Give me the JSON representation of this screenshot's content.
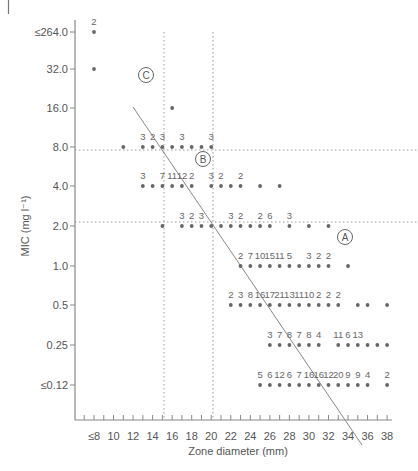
{
  "chart_data": {
    "type": "scatter",
    "title": "",
    "xlabel": "Zone diameter (mm)",
    "ylabel": "MIC (mg l⁻¹)",
    "x_ticks": [
      "≤8",
      "10",
      "12",
      "14",
      "16",
      "18",
      "20",
      "22",
      "24",
      "26",
      "28",
      "30",
      "32",
      "34",
      "36",
      "38"
    ],
    "y_ticks": [
      "≤264.0",
      "32.0",
      "16.0",
      "8.0",
      "4.0",
      "2.0",
      "1.0",
      "0.5",
      "0.25",
      "≤0.12"
    ],
    "x_range": [
      8,
      38
    ],
    "grid": false,
    "breakpoints": {
      "zone_vertical_mm": [
        15,
        20
      ],
      "mic_horizontal": [
        "8.0",
        "2.0"
      ]
    },
    "regression_line": {
      "from": {
        "x_mm": 12,
        "y_pixel_row": 107
      },
      "to": {
        "x_mm": 35.5,
        "y_pixel_row": 445
      }
    },
    "region_labels": [
      {
        "label": "A",
        "x_mm": 35,
        "mic": "between 2.0 and 1.0"
      },
      {
        "label": "B",
        "x_mm": 19,
        "mic": "between 8.0 and 4.0"
      },
      {
        "label": "C",
        "x_mm": 14,
        "mic": "32.0"
      }
    ],
    "rows": [
      {
        "mic": "≤264.0",
        "points": [
          {
            "x": 8,
            "n": "2"
          }
        ]
      },
      {
        "mic": "32.0",
        "points": [
          {
            "x": 8,
            "n": ""
          }
        ]
      },
      {
        "mic": "16.0",
        "points": [
          {
            "x": 16,
            "n": ""
          }
        ]
      },
      {
        "mic": "8.0",
        "points": [
          {
            "x": 11,
            "n": ""
          },
          {
            "x": 13,
            "n": "3"
          },
          {
            "x": 14,
            "n": "2"
          },
          {
            "x": 15,
            "n": "3"
          },
          {
            "x": 16,
            "n": ""
          },
          {
            "x": 17,
            "n": "3"
          },
          {
            "x": 18,
            "n": ""
          },
          {
            "x": 19,
            "n": ""
          },
          {
            "x": 20,
            "n": "3"
          }
        ]
      },
      {
        "mic": "4.0",
        "points": [
          {
            "x": 13,
            "n": "3"
          },
          {
            "x": 14,
            "n": ""
          },
          {
            "x": 15,
            "n": "7"
          },
          {
            "x": 16,
            "n": "11"
          },
          {
            "x": 17,
            "n": "12"
          },
          {
            "x": 18,
            "n": "2"
          },
          {
            "x": 20,
            "n": "3"
          },
          {
            "x": 21,
            "n": "2"
          },
          {
            "x": 22,
            "n": ""
          },
          {
            "x": 23,
            "n": "2"
          },
          {
            "x": 25,
            "n": ""
          },
          {
            "x": 27,
            "n": ""
          }
        ]
      },
      {
        "mic": "2.0",
        "points": [
          {
            "x": 15,
            "n": ""
          },
          {
            "x": 17,
            "n": "3"
          },
          {
            "x": 18,
            "n": "2"
          },
          {
            "x": 19,
            "n": "3"
          },
          {
            "x": 20,
            "n": ""
          },
          {
            "x": 21,
            "n": ""
          },
          {
            "x": 22,
            "n": "3"
          },
          {
            "x": 23,
            "n": "2"
          },
          {
            "x": 24,
            "n": ""
          },
          {
            "x": 25,
            "n": "2"
          },
          {
            "x": 26,
            "n": "6"
          },
          {
            "x": 28,
            "n": "3"
          },
          {
            "x": 30,
            "n": ""
          },
          {
            "x": 32,
            "n": ""
          }
        ]
      },
      {
        "mic": "1.0",
        "points": [
          {
            "x": 23,
            "n": "2"
          },
          {
            "x": 24,
            "n": "7"
          },
          {
            "x": 25,
            "n": "10"
          },
          {
            "x": 26,
            "n": "15"
          },
          {
            "x": 27,
            "n": "11"
          },
          {
            "x": 28,
            "n": "5"
          },
          {
            "x": 29,
            "n": ""
          },
          {
            "x": 30,
            "n": "3"
          },
          {
            "x": 31,
            "n": "2"
          },
          {
            "x": 32,
            "n": "2"
          },
          {
            "x": 34,
            "n": ""
          }
        ]
      },
      {
        "mic": "0.5",
        "points": [
          {
            "x": 22,
            "n": "2"
          },
          {
            "x": 23,
            "n": "3"
          },
          {
            "x": 24,
            "n": "8"
          },
          {
            "x": 25,
            "n": "16"
          },
          {
            "x": 26,
            "n": "17"
          },
          {
            "x": 27,
            "n": "21"
          },
          {
            "x": 28,
            "n": "13"
          },
          {
            "x": 29,
            "n": "11"
          },
          {
            "x": 30,
            "n": "10"
          },
          {
            "x": 31,
            "n": "2"
          },
          {
            "x": 32,
            "n": "2"
          },
          {
            "x": 33,
            "n": "2"
          },
          {
            "x": 35,
            "n": ""
          },
          {
            "x": 36,
            "n": ""
          },
          {
            "x": 38,
            "n": ""
          }
        ]
      },
      {
        "mic": "0.25",
        "points": [
          {
            "x": 26,
            "n": "3"
          },
          {
            "x": 27,
            "n": "7"
          },
          {
            "x": 28,
            "n": "8"
          },
          {
            "x": 29,
            "n": "7"
          },
          {
            "x": 30,
            "n": "8"
          },
          {
            "x": 31,
            "n": "4"
          },
          {
            "x": 33,
            "n": "11"
          },
          {
            "x": 34,
            "n": "6"
          },
          {
            "x": 35,
            "n": "13"
          },
          {
            "x": 36,
            "n": ""
          },
          {
            "x": 37,
            "n": ""
          },
          {
            "x": 38,
            "n": ""
          }
        ]
      },
      {
        "mic": "≤0.12",
        "points": [
          {
            "x": 25,
            "n": "5"
          },
          {
            "x": 26,
            "n": "6"
          },
          {
            "x": 27,
            "n": "12"
          },
          {
            "x": 28,
            "n": "6"
          },
          {
            "x": 29,
            "n": "7"
          },
          {
            "x": 30,
            "n": "16"
          },
          {
            "x": 31,
            "n": "16"
          },
          {
            "x": 32,
            "n": "12"
          },
          {
            "x": 33,
            "n": "20"
          },
          {
            "x": 34,
            "n": "9"
          },
          {
            "x": 35,
            "n": "9"
          },
          {
            "x": 36,
            "n": "4"
          },
          {
            "x": 38,
            "n": "2"
          }
        ]
      }
    ]
  },
  "colors": {
    "dot": "#666666",
    "axis": "#888888",
    "line": "#888888",
    "dotted": "#999999",
    "text": "#555555"
  }
}
